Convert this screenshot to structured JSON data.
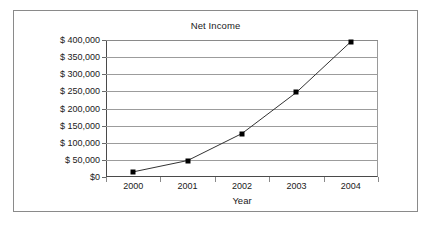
{
  "chart_data": {
    "type": "line",
    "title": "Net Income",
    "xlabel": "Year",
    "ylabel": "",
    "categories": [
      "2000",
      "2001",
      "2002",
      "2003",
      "2004"
    ],
    "values": [
      15000,
      48000,
      127000,
      247000,
      395000
    ],
    "series": [
      {
        "name": "Net Income",
        "values": [
          15000,
          48000,
          127000,
          247000,
          395000
        ]
      }
    ],
    "ylim": [
      0,
      400000
    ],
    "ytick_values": [
      0,
      50000,
      100000,
      150000,
      200000,
      250000,
      300000,
      350000,
      400000
    ],
    "ytick_labels": [
      "$0",
      "$ 50,000",
      "$ 100,000",
      "$ 150,000",
      "$ 200,000",
      "$ 250,000",
      "$ 300,000",
      "$ 350,000",
      "$ 400,000"
    ],
    "grid": "horizontal",
    "legend": "none",
    "marker": "square",
    "line_color": "#333333",
    "marker_color": "#000000",
    "grid_color": "#9c9c9c",
    "background_color": "#ffffff",
    "border_color": "#8a8a8a"
  }
}
